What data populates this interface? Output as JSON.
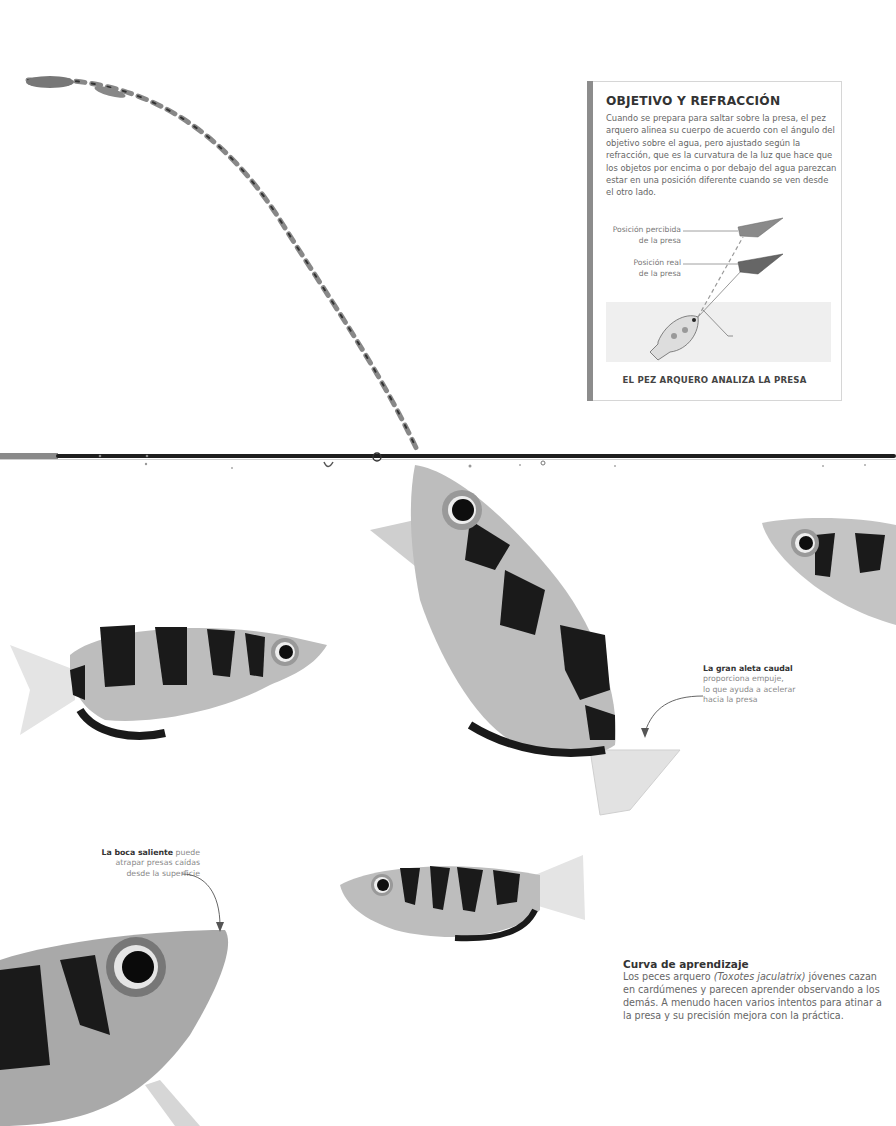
{
  "infobox": {
    "title": "OBJETIVO Y REFRACCIÓN",
    "body": "Cuando se prepara para saltar sobre la presa, el pez arquero alinea su cuerpo de acuerdo con el ángulo del objetivo sobre el agua, pero ajustado según la refracción, que es la curvatura de la luz que hace que los objetos por encima o por debajo del agua parezcan estar en una posición diferente cuando se ven desde el otro lado.",
    "diagram": {
      "label_perceived_line1": "Posición percibida",
      "label_perceived_line2": "de la presa",
      "label_real_line1": "Posición real",
      "label_real_line2": "de la presa",
      "label_refracted": "Luz refractada"
    },
    "caption": "EL PEZ ARQUERO ANALIZA LA PRESA"
  },
  "annotations": {
    "tail": {
      "bold": "La gran aleta caudal",
      "line1": "proporciona empuje,",
      "line2": "lo que ayuda a acelerar",
      "line3": "hacia la presa"
    },
    "mouth": {
      "bold": "La boca saliente",
      "line1_rest": " puede",
      "line2": "atrapar presas caídas",
      "line3": "desde la superficie"
    }
  },
  "learning": {
    "title": "Curva de aprendizaje",
    "pre": "Los peces arquero ",
    "species": "(Toxotes jaculatrix)",
    "post": " jóvenes cazan en cardúmenes y parecen aprender observando a los demás. A menudo hacen varios intentos para atinar a la presa y su precisión mejora con la práctica."
  },
  "colors": {
    "sidebar_bar": "#8c8c8c",
    "water_line": "#1e1e1e",
    "fish_body": "#bdbdbd",
    "fish_band": "#1a1a1a"
  }
}
